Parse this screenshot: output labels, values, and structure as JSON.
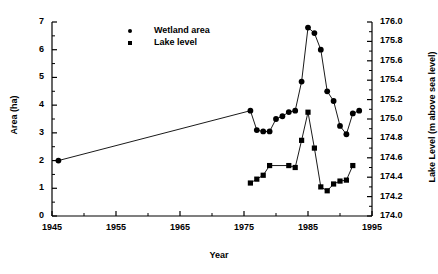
{
  "chart_data": {
    "type": "line",
    "title": "",
    "xlabel": "Year",
    "ylabel": "Area (ha)",
    "y2label": "Lake Level (m above sea level)",
    "xlim": [
      1945,
      1995
    ],
    "ylim": [
      0,
      7
    ],
    "y2lim": [
      174.0,
      176.0
    ],
    "xticks": [
      1945,
      1955,
      1965,
      1975,
      1985,
      1995
    ],
    "xticklabels": [
      "1945",
      "1955",
      "1965",
      "1975",
      "1985",
      "1995"
    ],
    "yticks": [
      0,
      1,
      2,
      3,
      4,
      5,
      6,
      7
    ],
    "yticklabels": [
      "0",
      "1",
      "2",
      "3",
      "4",
      "5",
      "6",
      "7"
    ],
    "y2ticks": [
      174.0,
      174.2,
      174.4,
      174.6,
      174.8,
      175.0,
      175.2,
      175.4,
      175.6,
      175.8,
      176.0
    ],
    "y2ticklabels": [
      "174.0",
      "174.2",
      "174.4",
      "174.6",
      "174.8",
      "175.0",
      "175.2",
      "175.4",
      "175.6",
      "175.8",
      "176.0"
    ],
    "grid": false,
    "legend_position": "upper-center",
    "series": [
      {
        "name": "Wetland area",
        "marker": "circle",
        "axis": "left",
        "color": "#000000",
        "points": [
          {
            "x": 1946,
            "y": 2.0
          },
          {
            "x": 1976,
            "y": 3.8
          },
          {
            "x": 1977,
            "y": 3.1
          },
          {
            "x": 1978,
            "y": 3.05
          },
          {
            "x": 1979,
            "y": 3.05
          },
          {
            "x": 1980,
            "y": 3.5
          },
          {
            "x": 1981,
            "y": 3.6
          },
          {
            "x": 1982,
            "y": 3.75
          },
          {
            "x": 1983,
            "y": 3.8
          },
          {
            "x": 1984,
            "y": 4.85
          },
          {
            "x": 1985,
            "y": 6.8
          },
          {
            "x": 1986,
            "y": 6.6
          },
          {
            "x": 1987,
            "y": 6.0
          },
          {
            "x": 1988,
            "y": 4.5
          },
          {
            "x": 1989,
            "y": 4.15
          },
          {
            "x": 1990,
            "y": 3.25
          },
          {
            "x": 1991,
            "y": 2.95
          },
          {
            "x": 1992,
            "y": 3.7
          },
          {
            "x": 1993,
            "y": 3.8
          }
        ]
      },
      {
        "name": "Lake level",
        "marker": "square",
        "axis": "right",
        "color": "#000000",
        "points": [
          {
            "x": 1976,
            "y": 174.34
          },
          {
            "x": 1977,
            "y": 174.38
          },
          {
            "x": 1978,
            "y": 174.42
          },
          {
            "x": 1979,
            "y": 174.52
          },
          {
            "x": 1982,
            "y": 174.52
          },
          {
            "x": 1983,
            "y": 174.5
          },
          {
            "x": 1984,
            "y": 174.78
          },
          {
            "x": 1985,
            "y": 175.07
          },
          {
            "x": 1986,
            "y": 174.7
          },
          {
            "x": 1987,
            "y": 174.3
          },
          {
            "x": 1988,
            "y": 174.26
          },
          {
            "x": 1989,
            "y": 174.33
          },
          {
            "x": 1990,
            "y": 174.36
          },
          {
            "x": 1991,
            "y": 174.37
          },
          {
            "x": 1992,
            "y": 174.52
          }
        ]
      }
    ],
    "legend": [
      {
        "label": "Wetland area",
        "marker": "circle"
      },
      {
        "label": "Lake level",
        "marker": "square"
      }
    ]
  }
}
